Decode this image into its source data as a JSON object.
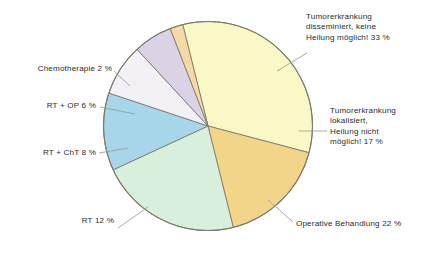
{
  "figure": {
    "background_color": "#ffffff",
    "outline_color": "#7a7a68"
  },
  "chart_data": {
    "type": "pie",
    "title": "",
    "subtitle": "",
    "xlabel": "",
    "ylabel": "",
    "legend_position": "none",
    "grid": false,
    "units": "%",
    "total": 100,
    "categories": [
      "Tumorerkrankung disseminiert, keine Heilung möglich!",
      "Tumorerkrankung lokalisiert, Heilung nicht möglich!",
      "Operative Behandlung",
      "RT",
      "RT + ChT",
      "RT + OP",
      "Chemotherapie"
    ],
    "values": [
      33,
      17,
      22,
      12,
      8,
      6,
      2
    ],
    "colors": [
      "#fbf8c8",
      "#f3d589",
      "#d8f0db",
      "#a7d5e9",
      "#f3f0f6",
      "#dcd2e6",
      "#f6d9a8"
    ],
    "slices": [
      {
        "key": "disseminiert",
        "label": "Tumorerkrankung\ndisseminiert, keine\nHeilung möglich! 33 %",
        "name": "Tumorerkrankung disseminiert, keine Heilung möglich!",
        "value": 33,
        "value_text": "33 %",
        "color": "#fbf8c8",
        "label_side": "right"
      },
      {
        "key": "lokalisiert",
        "label": "Tumorerkrankung\nlokalisiert,\nHeilung nicht\nmöglich! 17 %",
        "name": "Tumorerkrankung lokalisiert, Heilung nicht möglich!",
        "value": 17,
        "value_text": "17 %",
        "color": "#f3d589",
        "label_side": "right"
      },
      {
        "key": "operative",
        "label": "Operative Behandlung 22 %",
        "name": "Operative Behandlung",
        "value": 22,
        "value_text": "22 %",
        "color": "#d8f0db",
        "label_side": "right"
      },
      {
        "key": "rt",
        "label": "RT 12 %",
        "name": "RT",
        "value": 12,
        "value_text": "12 %",
        "color": "#a7d5e9",
        "label_side": "left"
      },
      {
        "key": "rtcht",
        "label": "RT + ChT 8 %",
        "name": "RT + ChT",
        "value": 8,
        "value_text": "8 %",
        "color": "#f3f0f6",
        "label_side": "left"
      },
      {
        "key": "rtop",
        "label": "RT + OP 6 %",
        "name": "RT + OP",
        "value": 6,
        "value_text": "6 %",
        "color": "#dcd2e6",
        "label_side": "left"
      },
      {
        "key": "chemo",
        "label": "Chemotherapie 2 %",
        "name": "Chemotherapie",
        "value": 2,
        "value_text": "2 %",
        "color": "#f6d9a8",
        "label_side": "left"
      }
    ]
  }
}
